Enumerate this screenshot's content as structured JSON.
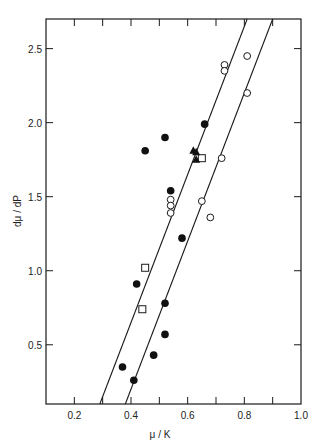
{
  "chart_data": {
    "type": "scatter",
    "title": "",
    "xlabel": "μ / K",
    "ylabel": "dμ / dP",
    "xlim": [
      0.1,
      1.0
    ],
    "ylim": [
      0.1,
      2.7
    ],
    "grid": false,
    "legend": "none",
    "x_ticks": [
      0.2,
      0.3,
      0.4,
      0.5,
      0.6,
      0.7,
      0.8,
      0.9
    ],
    "x_tick_labels": [
      "0.2",
      "",
      "0.4",
      "",
      "0.6",
      "",
      "0.8",
      "",
      "1.0"
    ],
    "x_labeled_ticks": [
      {
        "v": 0.2,
        "label": "0.2"
      },
      {
        "v": 0.4,
        "label": "0.4"
      },
      {
        "v": 0.6,
        "label": "0.6"
      },
      {
        "v": 0.8,
        "label": "0.8"
      },
      {
        "v": 1.0,
        "label": "1.0"
      }
    ],
    "y_labeled_ticks": [
      {
        "v": 0.5,
        "label": "0.5"
      },
      {
        "v": 1.0,
        "label": "1.0"
      },
      {
        "v": 1.5,
        "label": "1.5"
      },
      {
        "v": 2.0,
        "label": "2.0"
      },
      {
        "v": 2.5,
        "label": "2.5"
      }
    ],
    "series": [
      {
        "name": "filled circles",
        "marker": "filled-circle",
        "points": [
          [
            0.66,
            1.99
          ],
          [
            0.52,
            1.9
          ],
          [
            0.45,
            1.81
          ],
          [
            0.54,
            1.54
          ],
          [
            0.58,
            1.22
          ],
          [
            0.42,
            0.91
          ],
          [
            0.52,
            0.78
          ],
          [
            0.52,
            0.57
          ],
          [
            0.48,
            0.43
          ],
          [
            0.37,
            0.35
          ],
          [
            0.41,
            0.26
          ]
        ]
      },
      {
        "name": "open circles",
        "marker": "open-circle",
        "points": [
          [
            0.73,
            2.39
          ],
          [
            0.73,
            2.35
          ],
          [
            0.81,
            2.45
          ],
          [
            0.81,
            2.2
          ],
          [
            0.72,
            1.76
          ],
          [
            0.65,
            1.47
          ],
          [
            0.68,
            1.36
          ],
          [
            0.54,
            1.48
          ],
          [
            0.54,
            1.44
          ],
          [
            0.54,
            1.39
          ]
        ]
      },
      {
        "name": "open squares",
        "marker": "open-square",
        "points": [
          [
            0.65,
            1.76
          ],
          [
            0.45,
            1.02
          ],
          [
            0.44,
            0.74
          ]
        ]
      },
      {
        "name": "filled triangles",
        "marker": "filled-triangle",
        "points": [
          [
            0.62,
            1.81
          ],
          [
            0.63,
            1.8
          ],
          [
            0.63,
            1.75
          ]
        ]
      }
    ],
    "lines": [
      {
        "name": "upper bound line",
        "from": [
          0.29,
          0.1
        ],
        "to": [
          0.81,
          2.7
        ]
      },
      {
        "name": "lower bound line",
        "from": [
          0.38,
          0.1
        ],
        "to": [
          0.9,
          2.7
        ]
      }
    ]
  }
}
